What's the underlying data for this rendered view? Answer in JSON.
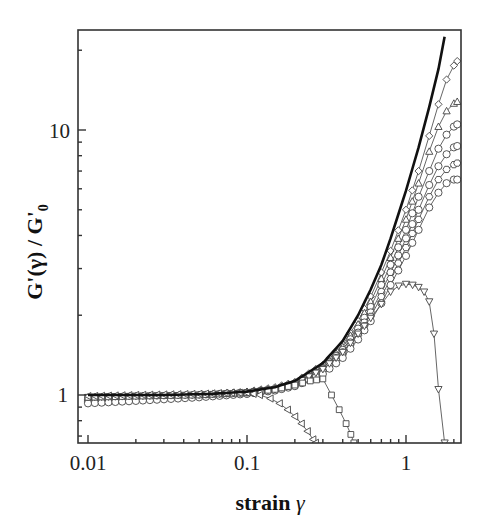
{
  "chart_data": {
    "type": "line",
    "title": "",
    "xlabel": "strain γ",
    "ylabel": "G'(γ) / G'0",
    "xscale": "log",
    "yscale": "log",
    "xlim": [
      0.0087,
      2.2
    ],
    "ylim": [
      0.66,
      23.8
    ],
    "grid": false,
    "legend": "none",
    "x_ticks": [
      {
        "value": 0.01,
        "label": "0.01"
      },
      {
        "value": 0.1,
        "label": "0.1"
      },
      {
        "value": 1,
        "label": "1"
      }
    ],
    "y_ticks": [
      {
        "value": 1,
        "label": "1"
      },
      {
        "value": 10,
        "label": "10"
      }
    ],
    "series": [
      {
        "name": "master-curve",
        "style": "solid-thick",
        "marker": "none",
        "x": [
          0.01,
          0.03,
          0.06,
          0.1,
          0.15,
          0.2,
          0.3,
          0.4,
          0.5,
          0.6,
          0.7,
          0.8,
          1.0,
          1.2,
          1.4,
          1.6,
          1.75
        ],
        "y": [
          1.0,
          1.0,
          1.01,
          1.03,
          1.07,
          1.13,
          1.32,
          1.6,
          2.0,
          2.5,
          3.1,
          3.9,
          5.9,
          8.6,
          12.2,
          17.0,
          22.5
        ]
      },
      {
        "name": "diamonds",
        "marker": "diamond",
        "x": [
          0.01,
          0.02,
          0.05,
          0.1,
          0.15,
          0.2,
          0.3,
          0.4,
          0.5,
          0.6,
          0.7,
          0.8,
          1.0,
          1.2,
          1.4,
          1.6,
          1.8,
          2.0,
          2.1
        ],
        "y": [
          0.98,
          0.99,
          1.0,
          1.03,
          1.07,
          1.12,
          1.3,
          1.55,
          1.9,
          2.35,
          2.9,
          3.5,
          5.0,
          7.0,
          9.5,
          12.5,
          15.5,
          17.5,
          18.2
        ]
      },
      {
        "name": "triangles-up",
        "marker": "triangle-up",
        "x": [
          0.01,
          0.02,
          0.05,
          0.1,
          0.15,
          0.2,
          0.3,
          0.4,
          0.5,
          0.6,
          0.7,
          0.8,
          1.0,
          1.2,
          1.4,
          1.6,
          1.8,
          2.0,
          2.1
        ],
        "y": [
          0.97,
          0.98,
          1.0,
          1.02,
          1.06,
          1.11,
          1.28,
          1.52,
          1.85,
          2.25,
          2.75,
          3.3,
          4.6,
          6.3,
          8.3,
          10.3,
          11.8,
          12.6,
          12.8
        ]
      },
      {
        "name": "circles-a",
        "marker": "circle",
        "x": [
          0.01,
          0.02,
          0.05,
          0.1,
          0.15,
          0.2,
          0.3,
          0.4,
          0.5,
          0.6,
          0.7,
          0.8,
          1.0,
          1.2,
          1.4,
          1.6,
          1.8,
          2.0,
          2.1
        ],
        "y": [
          0.96,
          0.98,
          0.99,
          1.02,
          1.05,
          1.1,
          1.26,
          1.48,
          1.78,
          2.15,
          2.6,
          3.1,
          4.2,
          5.6,
          7.0,
          8.5,
          9.6,
          10.3,
          10.5
        ]
      },
      {
        "name": "circles-b",
        "marker": "circle",
        "x": [
          0.01,
          0.02,
          0.05,
          0.1,
          0.15,
          0.2,
          0.3,
          0.4,
          0.5,
          0.6,
          0.7,
          0.8,
          1.0,
          1.2,
          1.4,
          1.6,
          1.8,
          2.0,
          2.1
        ],
        "y": [
          0.95,
          0.97,
          0.99,
          1.02,
          1.05,
          1.1,
          1.25,
          1.45,
          1.72,
          2.05,
          2.45,
          2.9,
          3.9,
          5.0,
          6.2,
          7.3,
          8.1,
          8.6,
          8.7
        ]
      },
      {
        "name": "hexagons",
        "marker": "hexagon",
        "x": [
          0.01,
          0.02,
          0.05,
          0.1,
          0.15,
          0.2,
          0.3,
          0.4,
          0.5,
          0.6,
          0.7,
          0.8,
          1.0,
          1.2,
          1.4,
          1.6,
          1.8,
          2.0,
          2.1
        ],
        "y": [
          0.94,
          0.96,
          0.99,
          1.01,
          1.04,
          1.09,
          1.23,
          1.42,
          1.68,
          1.98,
          2.35,
          2.75,
          3.6,
          4.6,
          5.6,
          6.5,
          7.1,
          7.4,
          7.5
        ]
      },
      {
        "name": "circles-c",
        "marker": "circle",
        "x": [
          0.01,
          0.02,
          0.05,
          0.1,
          0.15,
          0.2,
          0.3,
          0.4,
          0.5,
          0.6,
          0.7,
          0.8,
          1.0,
          1.2,
          1.4,
          1.6,
          1.8,
          2.0,
          2.1
        ],
        "y": [
          0.93,
          0.95,
          0.98,
          1.01,
          1.04,
          1.08,
          1.2,
          1.38,
          1.62,
          1.9,
          2.22,
          2.6,
          3.35,
          4.2,
          5.1,
          5.8,
          6.3,
          6.5,
          6.5
        ]
      },
      {
        "name": "triangles-down",
        "marker": "triangle-down",
        "x": [
          0.01,
          0.02,
          0.05,
          0.1,
          0.15,
          0.2,
          0.3,
          0.4,
          0.5,
          0.6,
          0.7,
          0.8,
          0.9,
          1.0,
          1.1,
          1.2,
          1.3,
          1.4,
          1.5,
          1.6,
          1.75
        ],
        "y": [
          0.98,
          0.99,
          1.0,
          1.02,
          1.05,
          1.1,
          1.25,
          1.45,
          1.7,
          1.95,
          2.2,
          2.45,
          2.58,
          2.62,
          2.6,
          2.55,
          2.45,
          2.25,
          1.7,
          1.05,
          0.66
        ]
      },
      {
        "name": "squares",
        "marker": "square",
        "x": [
          0.01,
          0.02,
          0.05,
          0.1,
          0.15,
          0.2,
          0.25,
          0.3,
          0.34,
          0.38,
          0.42,
          0.45,
          0.47
        ],
        "y": [
          0.98,
          0.99,
          1.0,
          1.02,
          1.05,
          1.09,
          1.13,
          1.15,
          1.0,
          0.88,
          0.78,
          0.71,
          0.66
        ]
      },
      {
        "name": "triangles-left",
        "marker": "triangle-left",
        "x": [
          0.01,
          0.02,
          0.05,
          0.08,
          0.1,
          0.12,
          0.14,
          0.16,
          0.18,
          0.2,
          0.22,
          0.24,
          0.26,
          0.27
        ],
        "y": [
          0.99,
          1.0,
          1.01,
          1.02,
          1.02,
          1.0,
          0.97,
          0.93,
          0.88,
          0.83,
          0.78,
          0.73,
          0.68,
          0.66
        ]
      }
    ]
  },
  "axes": {
    "x_title_main": "strain ",
    "x_title_symbol": "γ",
    "y_title_main": "G'(γ) / G'",
    "y_title_sub": "0",
    "x_tick_labels": [
      "0.01",
      "0.1",
      "1"
    ],
    "y_tick_labels": [
      "1",
      "10"
    ]
  }
}
